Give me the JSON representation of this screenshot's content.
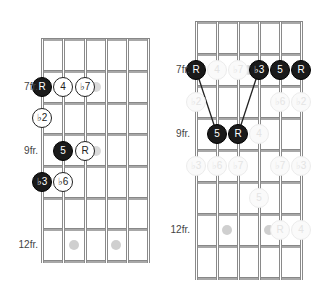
{
  "diagrams": [
    {
      "id": "left",
      "fret_labels": [
        {
          "text": "7fr.",
          "y": 87
        },
        {
          "text": "9fr.",
          "y": 151
        },
        {
          "text": "12fr.",
          "y": 245
        }
      ],
      "notes": [
        {
          "label": "R",
          "style": "black",
          "x": 42,
          "y": 87
        },
        {
          "label": "4",
          "style": "white",
          "x": 63,
          "y": 87
        },
        {
          "label": "♭7",
          "style": "white",
          "x": 85,
          "y": 87
        },
        {
          "label": "♭2",
          "style": "white",
          "x": 42,
          "y": 118
        },
        {
          "label": "5",
          "style": "black",
          "x": 63,
          "y": 151
        },
        {
          "label": "R",
          "style": "white",
          "x": 85,
          "y": 151
        },
        {
          "label": "♭3",
          "style": "black",
          "x": 42,
          "y": 182
        },
        {
          "label": "♭6",
          "style": "white",
          "x": 63,
          "y": 182
        }
      ],
      "shades": [
        {
          "x": 96,
          "y": 87
        },
        {
          "x": 96,
          "y": 151
        }
      ],
      "markers": [
        {
          "x": 74,
          "y": 245
        },
        {
          "x": 116,
          "y": 245
        }
      ]
    },
    {
      "id": "right",
      "fret_labels": [
        {
          "text": "7fr.",
          "y": 70
        },
        {
          "text": "9fr.",
          "y": 134
        },
        {
          "text": "12fr.",
          "y": 230
        }
      ],
      "notes": [
        {
          "label": "R",
          "style": "black",
          "x": 196,
          "y": 70
        },
        {
          "label": "4",
          "style": "ghost",
          "x": 217,
          "y": 70
        },
        {
          "label": "♭7",
          "style": "ghost",
          "x": 238,
          "y": 70
        },
        {
          "label": "♭3",
          "style": "black",
          "x": 259,
          "y": 70
        },
        {
          "label": "5",
          "style": "black",
          "x": 280,
          "y": 70
        },
        {
          "label": "R",
          "style": "black",
          "x": 301,
          "y": 70
        },
        {
          "label": "♭2",
          "style": "ghost",
          "x": 196,
          "y": 102
        },
        {
          "label": "♭6",
          "style": "ghost",
          "x": 280,
          "y": 102
        },
        {
          "label": "♭2",
          "style": "ghost",
          "x": 301,
          "y": 102
        },
        {
          "label": "5",
          "style": "black",
          "x": 217,
          "y": 134
        },
        {
          "label": "R",
          "style": "black",
          "x": 238,
          "y": 134
        },
        {
          "label": "4",
          "style": "ghost",
          "x": 259,
          "y": 134
        },
        {
          "label": "♭3",
          "style": "ghost",
          "x": 196,
          "y": 166
        },
        {
          "label": "♭6",
          "style": "ghost",
          "x": 217,
          "y": 166
        },
        {
          "label": "♭7",
          "style": "ghost",
          "x": 238,
          "y": 166
        },
        {
          "label": "♭7",
          "style": "ghost",
          "x": 280,
          "y": 166
        },
        {
          "label": "♭3",
          "style": "ghost",
          "x": 301,
          "y": 166
        },
        {
          "label": "5",
          "style": "ghost",
          "x": 259,
          "y": 198
        },
        {
          "label": "R",
          "style": "ghost",
          "x": 280,
          "y": 230
        },
        {
          "label": "4",
          "style": "ghost",
          "x": 301,
          "y": 230
        }
      ],
      "shades": [
        {
          "x": 249,
          "y": 70
        }
      ],
      "markers": [
        {
          "x": 227,
          "y": 230
        },
        {
          "x": 269,
          "y": 230
        }
      ],
      "connectors": [
        {
          "x1": 196,
          "y1": 70,
          "x2": 217,
          "y2": 134
        },
        {
          "x1": 238,
          "y1": 134,
          "x2": 259,
          "y2": 70
        }
      ]
    }
  ]
}
